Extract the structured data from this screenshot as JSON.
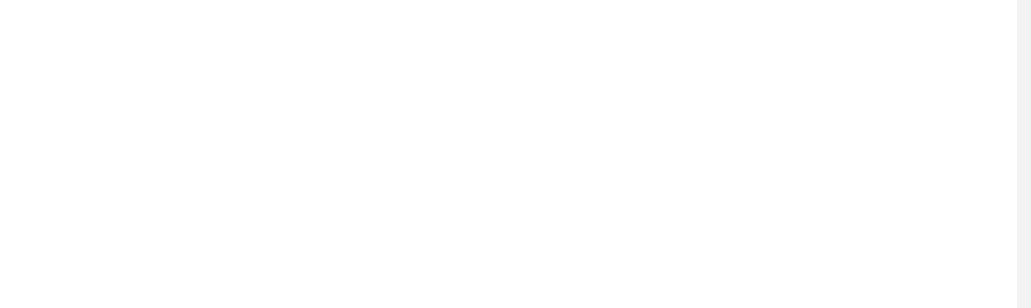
{
  "staff": {
    "line_ys": [
      105,
      134,
      164,
      193,
      223
    ],
    "left": 59,
    "right": 1003,
    "color": "#1a1a1a"
  },
  "barlines": [
    59,
    361,
    706,
    995
  ],
  "final_bar": {
    "x": 1003,
    "width": 7
  },
  "chords": [
    {
      "x": 113,
      "y": 67,
      "label": "C",
      "superscript": ""
    },
    {
      "x": 417,
      "y": 67,
      "label": "G",
      "superscript": "G7"
    },
    {
      "x": 762,
      "y": 67,
      "label": "C",
      "superscript": ""
    }
  ],
  "notes": [
    {
      "x": 113,
      "y": 150,
      "letter": "C",
      "filled": false,
      "double_ring": true,
      "dotted": true,
      "stem": "down",
      "stem_x": 97,
      "stem_end": 238
    },
    {
      "x": 302,
      "y": 150,
      "letter": "C",
      "filled": true,
      "dotted": false,
      "stem": "down",
      "stem_x": 287,
      "stem_end": 238
    },
    {
      "x": 415,
      "y": 150,
      "letter": "C",
      "filled": true,
      "dotted": false,
      "stem": "down",
      "stem_x": 400,
      "stem_end": 238
    },
    {
      "x": 492,
      "y": 181,
      "letter": "A",
      "filled": false,
      "dotted": false,
      "stem": "up",
      "stem_x": 507,
      "stem_end": 90
    },
    {
      "x": 645,
      "y": 193,
      "letter": "G",
      "filled": true,
      "dotted": false,
      "stem": "up",
      "stem_x": 661,
      "stem_end": 104
    },
    {
      "x": 760,
      "y": 178,
      "letter": "A",
      "filled": true,
      "dotted": false,
      "stem": "up",
      "stem_x": 776,
      "stem_end": 89
    },
    {
      "x": 836,
      "y": 192,
      "letter": "G",
      "filled": true,
      "dotted": false,
      "stem": "up",
      "stem_x": 852,
      "stem_end": 104
    },
    {
      "x": 913,
      "y": 192,
      "letter": "G",
      "filled": false,
      "double_ring": true,
      "dotted": false,
      "stem": "up",
      "stem_x": 929,
      "stem_end": 104
    }
  ],
  "lyrics": [
    {
      "x": 115,
      "text": "I"
    },
    {
      "x": 303,
      "text": "act"
    },
    {
      "x": 417,
      "text": "just"
    },
    {
      "x": 493,
      "text": "like"
    },
    {
      "x": 647,
      "text": "those"
    },
    {
      "x": 762,
      "text": "mon"
    },
    {
      "x": 797,
      "text": "-"
    },
    {
      "x": 838,
      "text": "keys"
    },
    {
      "x": 915,
      "text": "act."
    }
  ],
  "lyrics_y": 281
}
